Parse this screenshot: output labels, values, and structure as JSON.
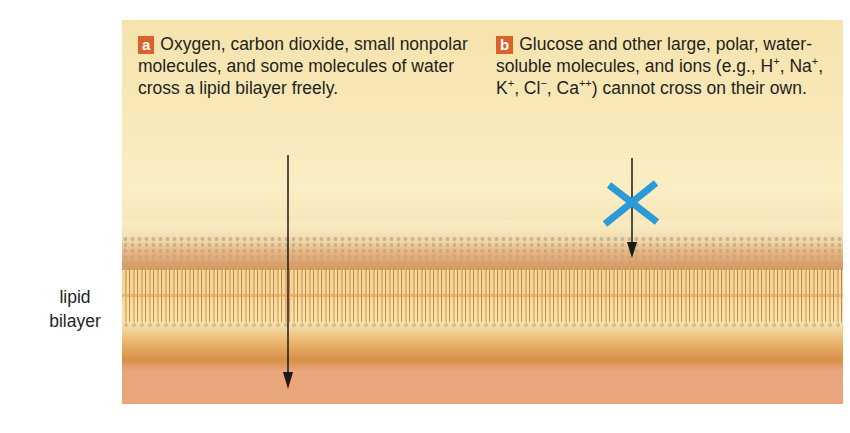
{
  "diagram": {
    "label_side": "lipid bilayer",
    "label_side_lines": [
      "lipid",
      "bilayer"
    ],
    "panels": [
      {
        "badge": "a",
        "text": "Oxygen, carbon dioxide, small nonpolar molecules, and some molecules of water cross a lipid bilayer freely.",
        "arrow": "passes through bilayer"
      },
      {
        "badge": "b",
        "text_before_ions": "Glucose and other large, polar, water-soluble molecules, and ions (e.g., ",
        "ions": [
          "H",
          "Na",
          "K",
          "Cl",
          "Ca"
        ],
        "ion_charges": [
          "+",
          "+",
          "+",
          "−",
          "++"
        ],
        "text_after_ions": ") cannot cross on their own.",
        "arrow": "blocked at bilayer",
        "block_symbol": "blue-x"
      }
    ],
    "colors": {
      "badge": "#d9622b",
      "block_x": "#2b9bd8",
      "arrow": "#1a1a1a",
      "upper_fluid": "#f8e8b8",
      "lower_fluid": "#eaa57c"
    }
  }
}
